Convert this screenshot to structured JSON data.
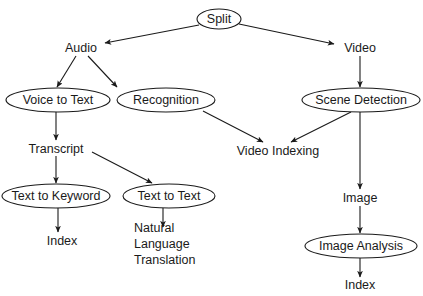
{
  "diagram": {
    "title": "Split",
    "background_color": "#ffffff",
    "stroke_color": "#1a1a1a",
    "text_color": "#1a1a1a",
    "nodes": [
      {
        "id": "split",
        "label": "Split",
        "shape": "ellipse",
        "cx": 219,
        "cy": 19,
        "rx": 22,
        "ry": 10
      },
      {
        "id": "audio",
        "label": "Audio",
        "shape": "text",
        "cx": 81,
        "cy": 48
      },
      {
        "id": "video",
        "label": "Video",
        "shape": "text",
        "cx": 360,
        "cy": 48
      },
      {
        "id": "voice_to_text",
        "label": "Voice to Text",
        "shape": "ellipse",
        "cx": 58,
        "cy": 100,
        "rx": 52,
        "ry": 12
      },
      {
        "id": "recognition",
        "label": "Recognition",
        "shape": "ellipse",
        "cx": 166,
        "cy": 100,
        "rx": 49,
        "ry": 12
      },
      {
        "id": "scene_detection",
        "label": "Scene Detection",
        "shape": "ellipse",
        "cx": 361,
        "cy": 100,
        "rx": 59,
        "ry": 12
      },
      {
        "id": "transcript",
        "label": "Transcript",
        "shape": "text",
        "cx": 56,
        "cy": 149
      },
      {
        "id": "video_indexing",
        "label": "Video Indexing",
        "shape": "text",
        "cx": 278,
        "cy": 151
      },
      {
        "id": "text_to_keyword",
        "label": "Text to Keyword",
        "shape": "ellipse",
        "cx": 56,
        "cy": 196,
        "rx": 54,
        "ry": 12
      },
      {
        "id": "text_to_text",
        "label": "Text to Text",
        "shape": "ellipse",
        "cx": 169,
        "cy": 196,
        "rx": 46,
        "ry": 12
      },
      {
        "id": "index_left",
        "label": "Index",
        "shape": "text",
        "cx": 62,
        "cy": 241
      },
      {
        "id": "image",
        "label": "Image",
        "shape": "text",
        "cx": 360,
        "cy": 198
      },
      {
        "id": "image_analysis",
        "label": "Image Analysis",
        "shape": "ellipse",
        "cx": 361,
        "cy": 246,
        "rx": 56,
        "ry": 12
      },
      {
        "id": "index_right",
        "label": "Index",
        "shape": "text",
        "cx": 360,
        "cy": 285
      }
    ],
    "multiline_nodes": [
      {
        "id": "natural_language_translation",
        "lines": [
          "Natural",
          "Language",
          "Translation"
        ],
        "x": 134,
        "y": 229
      }
    ],
    "edges": [
      {
        "id": "split-audio",
        "from": "split",
        "to": "audio",
        "x1": 199,
        "y1": 25,
        "x2": 105,
        "y2": 43
      },
      {
        "id": "split-video",
        "from": "split",
        "to": "video",
        "x1": 239,
        "y1": 24,
        "x2": 334,
        "y2": 44
      },
      {
        "id": "audio-voice-to-text",
        "from": "audio",
        "to": "voice_to_text",
        "x1": 76,
        "y1": 56,
        "x2": 57,
        "y2": 87
      },
      {
        "id": "audio-recognition-branch",
        "from": "audio",
        "to": "branch",
        "x1": 88,
        "y1": 56,
        "x2": 117,
        "y2": 87
      },
      {
        "id": "video-scene-detection",
        "from": "video",
        "to": "scene_detection",
        "x1": 360,
        "y1": 56,
        "x2": 360,
        "y2": 87
      },
      {
        "id": "voice-to-text-transcript",
        "from": "voice_to_text",
        "to": "transcript",
        "x1": 56,
        "y1": 112,
        "x2": 56,
        "y2": 140
      },
      {
        "id": "recognition-video-indexing",
        "from": "recognition",
        "to": "video_indexing",
        "x1": 203,
        "y1": 111,
        "x2": 263,
        "y2": 142
      },
      {
        "id": "scene-detection-video-indexing",
        "from": "scene_detection",
        "to": "video_indexing",
        "x1": 351,
        "y1": 112,
        "x2": 291,
        "y2": 142
      },
      {
        "id": "scene-detection-image",
        "from": "scene_detection",
        "to": "image",
        "x1": 360,
        "y1": 112,
        "x2": 360,
        "y2": 189
      },
      {
        "id": "transcript-text-to-keyword",
        "from": "transcript",
        "to": "text_to_keyword",
        "x1": 56,
        "y1": 156,
        "x2": 56,
        "y2": 183
      },
      {
        "id": "transcript-text-to-text",
        "from": "transcript",
        "to": "text_to_text",
        "x1": 92,
        "y1": 152,
        "x2": 152,
        "y2": 183
      },
      {
        "id": "text-to-keyword-index",
        "from": "text_to_keyword",
        "to": "index_left",
        "x1": 58,
        "y1": 208,
        "x2": 58,
        "y2": 232
      },
      {
        "id": "text-to-text-natural-language",
        "from": "text_to_text",
        "to": "natural_language_translation",
        "x1": 163,
        "y1": 208,
        "x2": 163,
        "y2": 227
      },
      {
        "id": "image-image-analysis",
        "from": "image",
        "to": "image_analysis",
        "x1": 360,
        "y1": 206,
        "x2": 360,
        "y2": 233
      },
      {
        "id": "image-analysis-index",
        "from": "image_analysis",
        "to": "index_right",
        "x1": 360,
        "y1": 258,
        "x2": 360,
        "y2": 277
      }
    ]
  }
}
